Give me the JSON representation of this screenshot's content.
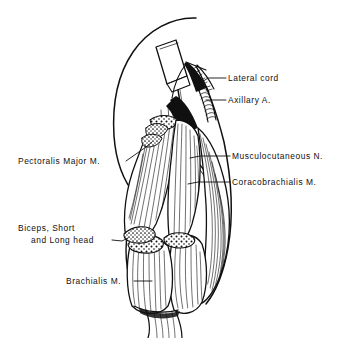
{
  "figure": {
    "background_color": "#ffffff",
    "ink_color": "#101010",
    "width": 359,
    "height": 338
  },
  "labels": {
    "lateral_cord": "Lateral cord",
    "axillary_artery": "Axillary A.",
    "musculocutaneous_nerve": "Musculocutaneous N.",
    "coracobrachialis": "Coracobrachialis M.",
    "pectoralis_major": "Pectoralis Major M.",
    "biceps_line1": "Biceps, Short",
    "biceps_line2": "and Long head",
    "brachialis": "Brachialis M."
  },
  "structures": {
    "syringe": "syringe-with-needle",
    "retracted_muscle_arc": "pectoralis-major-retracted-edge",
    "cut_muscle_ends": "stippled-cut-muscle-surface",
    "muscle_striations": "longitudinal-muscle-fiber-hatching",
    "vessel": "coiled-axillary-artery",
    "nerve_cord": "hatched-lateral-cord"
  }
}
